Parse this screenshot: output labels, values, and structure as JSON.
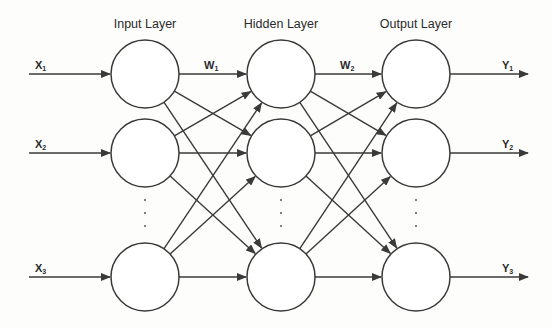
{
  "diagram": {
    "type": "feedforward-neural-network",
    "layers": [
      {
        "id": "input",
        "title": "Input Layer",
        "node_count_shown": 3,
        "has_ellipsis": true
      },
      {
        "id": "hidden",
        "title": "Hidden Layer",
        "node_count_shown": 3,
        "has_ellipsis": true
      },
      {
        "id": "output",
        "title": "Output Layer",
        "node_count_shown": 3,
        "has_ellipsis": true
      }
    ],
    "inputs": [
      {
        "base": "X",
        "sub": "1"
      },
      {
        "base": "X",
        "sub": "2"
      },
      {
        "base": "X",
        "sub": "3"
      }
    ],
    "outputs": [
      {
        "base": "Y",
        "sub": "1"
      },
      {
        "base": "Y",
        "sub": "2"
      },
      {
        "base": "Y",
        "sub": "3"
      }
    ],
    "weights": [
      {
        "base": "W",
        "sub": "1",
        "between": [
          "input",
          "hidden"
        ]
      },
      {
        "base": "W",
        "sub": "2",
        "between": [
          "hidden",
          "output"
        ]
      }
    ],
    "connectivity": "fully-connected",
    "colors": {
      "stroke": "#3a3a3a",
      "text": "#2a2a2a",
      "background": "#fdfdfc"
    }
  }
}
